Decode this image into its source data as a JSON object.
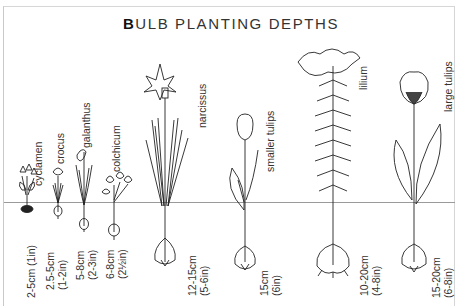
{
  "diagram": {
    "title_first_letter": "B",
    "title_rest": "ULB PLANTING DEPTHS",
    "ground_line": "soil surface",
    "plants": [
      {
        "name": "cyclamen",
        "depth_cm": "2-5cm (1in)",
        "depth_in": ""
      },
      {
        "name": "crocus",
        "depth_cm": "2.5-5cm",
        "depth_in": "(1-2in)"
      },
      {
        "name": "galanthus",
        "depth_cm": "5-8cm",
        "depth_in": "(2-3in)"
      },
      {
        "name": "colchicum",
        "depth_cm": "6-8cm",
        "depth_in": "(2½in)"
      },
      {
        "name": "narcissus",
        "depth_cm": "12-15cm",
        "depth_in": "(5-6in)"
      },
      {
        "name": "smaller tulips",
        "depth_cm": "15cm",
        "depth_in": "(6in)"
      },
      {
        "name": "lilium",
        "depth_cm": "10-20cm",
        "depth_in": "(4-8in)"
      },
      {
        "name": "large tulips",
        "depth_cm": "15-20cm",
        "depth_in": "(6-8in)"
      }
    ],
    "colors": {
      "line": "#222222",
      "ground": "#9a9a9a",
      "background": "#ffffff"
    }
  }
}
